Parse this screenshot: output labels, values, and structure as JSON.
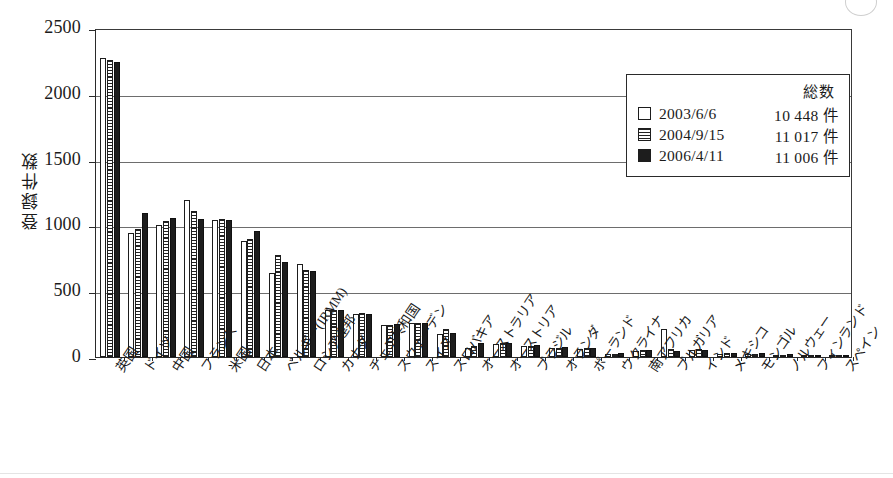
{
  "chart_data": {
    "type": "bar",
    "title": "",
    "xlabel": "",
    "ylabel": "登録件数",
    "ylim": [
      0,
      2500
    ],
    "yticks": [
      0,
      500,
      1000,
      1500,
      2000,
      2500
    ],
    "grid": true,
    "legend_position": "top-right",
    "categories": [
      "英国",
      "ドイツ",
      "中国",
      "フランス",
      "米国",
      "日本",
      "ベルギー(IRMM)",
      "ロシア連邦",
      "カナダ",
      "チェコ共和国",
      "スウェーデン",
      "スイス",
      "スロバキア",
      "オーストラリア",
      "オーストリア",
      "ブラジル",
      "オランダ",
      "ポーランド",
      "ウクライナ",
      "南アフリカ",
      "ブルガリア",
      "インド",
      "メキシコ",
      "モンゴル",
      "ノルウェー",
      "フィンランド",
      "スペイン"
    ],
    "series": [
      {
        "name": "2003/6/6",
        "total": "10 448 件",
        "pattern": "white",
        "values": [
          2270,
          945,
          1005,
          1190,
          1040,
          880,
          640,
          705,
          355,
          330,
          245,
          255,
          175,
          65,
          100,
          80,
          70,
          60,
          20,
          45,
          215,
          55,
          25,
          20,
          15,
          8,
          5
        ]
      },
      {
        "name": "2004/9/15",
        "total": "11 017 件",
        "pattern": "striped",
        "values": [
          2260,
          975,
          1035,
          1110,
          1045,
          900,
          775,
          665,
          355,
          335,
          245,
          255,
          215,
          80,
          105,
          85,
          72,
          65,
          25,
          50,
          60,
          60,
          30,
          22,
          18,
          10,
          6
        ]
      },
      {
        "name": "2006/4/11",
        "total": "11 006 件",
        "pattern": "solid",
        "values": [
          2240,
          1095,
          1055,
          1050,
          1040,
          955,
          720,
          655,
          355,
          330,
          250,
          255,
          180,
          110,
          105,
          95,
          75,
          68,
          28,
          52,
          45,
          50,
          32,
          28,
          20,
          12,
          8
        ]
      }
    ]
  },
  "legend": {
    "total_header": "総数"
  }
}
